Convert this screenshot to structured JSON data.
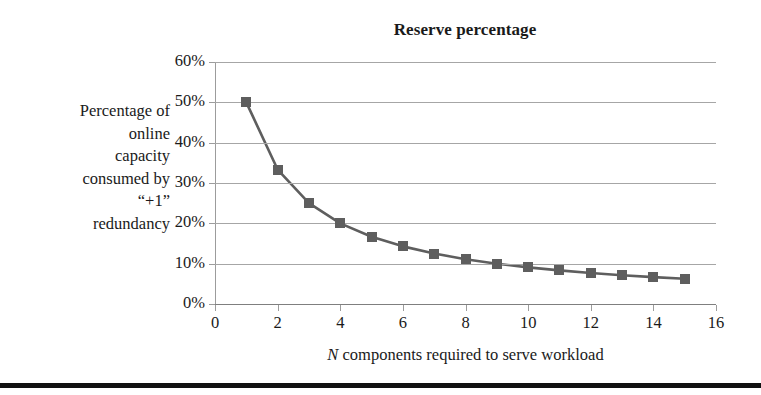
{
  "chart_data": {
    "type": "line",
    "title": "Reserve percentage",
    "xlabel_prefix": "N",
    "xlabel_rest": " components required to serve workload",
    "xlabel": "N components required to serve workload",
    "ylabel_lines": [
      "Percentage of",
      "online",
      "capacity",
      "consumed by",
      "“+1”",
      "redundancy"
    ],
    "ylabel": "Percentage of online capacity consumed by “+1” redundancy",
    "x": [
      1,
      2,
      3,
      4,
      5,
      6,
      7,
      8,
      9,
      10,
      11,
      12,
      13,
      14,
      15
    ],
    "values": [
      0.5,
      0.3333,
      0.25,
      0.2,
      0.1667,
      0.1429,
      0.125,
      0.1111,
      0.1,
      0.0909,
      0.0833,
      0.0769,
      0.0714,
      0.0667,
      0.0625
    ],
    "value_labels": [
      "50%",
      "33%",
      "25%",
      "20%",
      "17%",
      "14%",
      "13%",
      "11%",
      "10%",
      "9%",
      "8%",
      "8%",
      "7%",
      "7%",
      "6%"
    ],
    "xlim": [
      0,
      16
    ],
    "ylim": [
      0,
      0.6
    ],
    "xticks": [
      0,
      2,
      4,
      6,
      8,
      10,
      12,
      14,
      16
    ],
    "xtick_labels": [
      "0",
      "2",
      "4",
      "6",
      "8",
      "10",
      "12",
      "14",
      "16"
    ],
    "yticks": [
      0,
      0.1,
      0.2,
      0.3,
      0.4,
      0.5,
      0.6
    ],
    "ytick_labels": [
      "0%",
      "10%",
      "20%",
      "30%",
      "40%",
      "50%",
      "60%"
    ],
    "grid": "horizontal",
    "legend": "none",
    "series_color": "#5e5e5e",
    "gridline_color": "#a6a6a6",
    "marker": "square"
  }
}
